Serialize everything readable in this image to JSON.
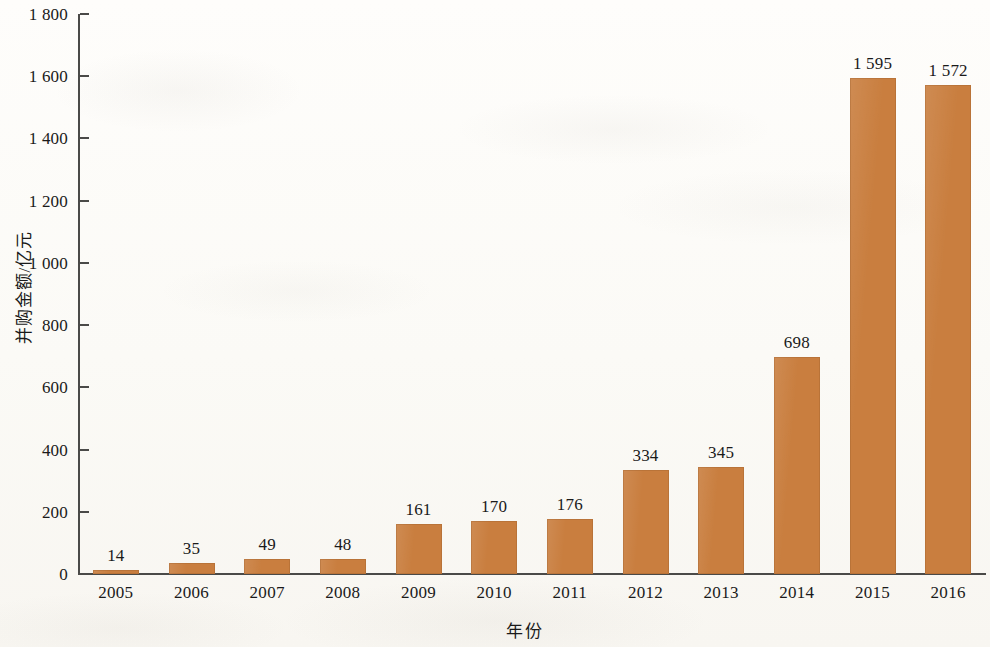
{
  "chart_data": {
    "type": "bar",
    "title": "",
    "subtitle": "",
    "xlabel": "年份",
    "ylabel": "并购金额/亿元",
    "categories": [
      "2005",
      "2006",
      "2007",
      "2008",
      "2009",
      "2010",
      "2011",
      "2012",
      "2013",
      "2014",
      "2015",
      "2016"
    ],
    "values": [
      14,
      35,
      49,
      48,
      161,
      170,
      176,
      334,
      345,
      698,
      1595,
      1572
    ],
    "value_labels": [
      "14",
      "35",
      "49",
      "48",
      "161",
      "170",
      "176",
      "334",
      "345",
      "698",
      "1 595",
      "1 572"
    ],
    "ylim": [
      0,
      1800
    ],
    "ytick_values": [
      0,
      200,
      400,
      600,
      800,
      1000,
      1200,
      1400,
      1600,
      1800
    ],
    "ytick_labels": [
      "0",
      "200",
      "400",
      "600",
      "800",
      "1 000",
      "1 200",
      "1 400",
      "1 600",
      "1 800"
    ],
    "grid": false,
    "legend": false,
    "legend_position": "none",
    "bar_color": "#c97e3f",
    "axis_color": "#4a4a48",
    "background_color": "#fdfcf9",
    "text_color": "#1a1a1a",
    "series": [
      {
        "name": "并购金额",
        "unit": "亿元",
        "values": [
          14,
          35,
          49,
          48,
          161,
          170,
          176,
          334,
          345,
          698,
          1595,
          1572
        ]
      }
    ]
  }
}
